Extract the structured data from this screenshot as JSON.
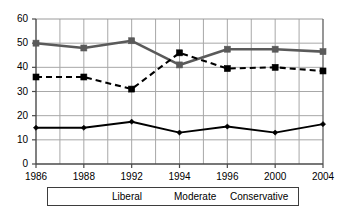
{
  "chart_data": {
    "type": "line",
    "title": "",
    "xlabel": "",
    "ylabel": "",
    "categories": [
      "1986",
      "1988",
      "1992",
      "1994",
      "1996",
      "2000",
      "2004"
    ],
    "ylim": [
      0,
      60
    ],
    "ytick_labels": [
      "0",
      "10",
      "20",
      "30",
      "40",
      "50",
      "60"
    ],
    "ytick_values": [
      0,
      10,
      20,
      30,
      40,
      50,
      60
    ],
    "grid": "both",
    "legend_position": "bottom",
    "series": [
      {
        "name": "Liberal",
        "marker": "diamond",
        "line_style": "solid",
        "color": "#000000",
        "values": [
          15,
          15,
          17.5,
          13,
          15.5,
          13,
          16.5
        ]
      },
      {
        "name": "Moderate",
        "marker": "square",
        "line_style": "solid",
        "color": "#5a5a5a",
        "values": [
          50,
          48,
          51,
          41,
          47.5,
          47.5,
          46.5
        ]
      },
      {
        "name": "Conservative",
        "marker": "square",
        "line_style": "dashed",
        "color": "#000000",
        "values": [
          36,
          36,
          31,
          46,
          39.5,
          40,
          38.5
        ]
      }
    ]
  },
  "legend": {
    "entries": [
      {
        "label": "Liberal"
      },
      {
        "label": "Moderate"
      },
      {
        "label": "Conservative"
      }
    ]
  },
  "colors": {
    "liberal": "#000000",
    "moderate": "#5a5a5a",
    "conservative": "#000000",
    "grid": "#a8a8a8",
    "axis": "#4a4a4a",
    "background": "#ffffff"
  }
}
